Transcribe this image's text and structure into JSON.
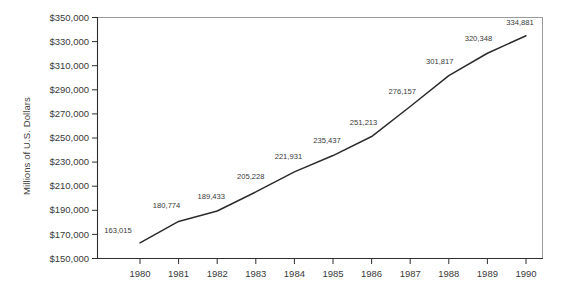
{
  "chart_data": {
    "type": "line",
    "title": "",
    "xlabel": "",
    "ylabel": "Millions of U.S. Dollars",
    "categories": [
      "1980",
      "1981",
      "1982",
      "1983",
      "1984",
      "1985",
      "1986",
      "1987",
      "1988",
      "1989",
      "1990"
    ],
    "x": [
      1980,
      1981,
      1982,
      1983,
      1984,
      1985,
      1986,
      1987,
      1988,
      1989,
      1990
    ],
    "values": [
      163015,
      180774,
      189433,
      205228,
      221931,
      235437,
      251213,
      276157,
      301817,
      320348,
      334881
    ],
    "point_labels": [
      "163,015",
      "180,774",
      "189,433",
      "205,228",
      "221,931",
      "235,437",
      "251,213",
      "276,157",
      "301,817",
      "320,348",
      "334,881"
    ],
    "ylim": [
      150000,
      350000
    ],
    "ytick_values": [
      150000,
      170000,
      190000,
      210000,
      230000,
      250000,
      270000,
      290000,
      310000,
      330000,
      350000
    ],
    "ytick_labels": [
      "$150,000",
      "$170,000",
      "$190,000",
      "$210,000",
      "$230,000",
      "$250,000",
      "$270,000",
      "$290,000",
      "$310,000",
      "$330,000",
      "$350,000"
    ],
    "grid": false,
    "legend": null,
    "line_color": "#2b2b2b",
    "axis_color": "#2e2e2e",
    "frame_color": "#9a9a9a",
    "background_color": "#ffffff"
  }
}
